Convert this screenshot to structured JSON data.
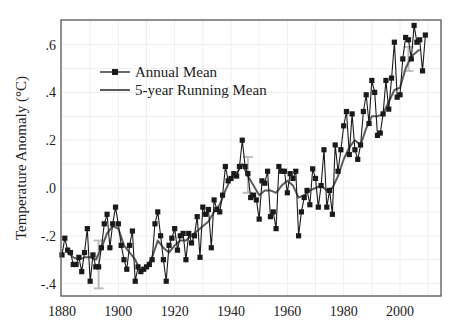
{
  "chart_data": {
    "type": "line",
    "title": "",
    "xlabel": "",
    "ylabel": "Temperature Anomaly (°C)",
    "xlim": [
      1880,
      2010
    ],
    "ylim": [
      -0.45,
      0.7
    ],
    "x_ticks": [
      1880,
      1900,
      1920,
      1940,
      1960,
      1980,
      2000
    ],
    "x_tick_labels": [
      "1880",
      "1900",
      "1920",
      "1940",
      "1960",
      "1980",
      "2000"
    ],
    "y_ticks": [
      -0.4,
      -0.2,
      0.0,
      0.2,
      0.4,
      0.6
    ],
    "y_tick_labels": [
      "-.4",
      "-.2",
      ".0",
      ".2",
      ".4",
      ".6"
    ],
    "grid": true,
    "legend_position": "upper-left",
    "legend": [
      "Annual Mean",
      "5-year Running Mean"
    ],
    "colors": {
      "annual": "#1a1a1a",
      "running": "#5a5a5a",
      "error_bars": "#bdbdbd",
      "grid": "#efefef",
      "axes": "#555555"
    },
    "error_bars": [
      {
        "x": 1893,
        "low": -0.42,
        "high": -0.22
      },
      {
        "x": 1946,
        "low": -0.02,
        "high": 0.13
      },
      {
        "x": 2003,
        "low": 0.49,
        "high": 0.59
      }
    ],
    "series": [
      {
        "name": "Annual Mean",
        "marker": "square",
        "x": [
          1880,
          1881,
          1882,
          1883,
          1884,
          1885,
          1886,
          1887,
          1888,
          1889,
          1890,
          1891,
          1892,
          1893,
          1894,
          1895,
          1896,
          1897,
          1898,
          1899,
          1900,
          1901,
          1902,
          1903,
          1904,
          1905,
          1906,
          1907,
          1908,
          1909,
          1910,
          1911,
          1912,
          1913,
          1914,
          1915,
          1916,
          1917,
          1918,
          1919,
          1920,
          1921,
          1922,
          1923,
          1924,
          1925,
          1926,
          1927,
          1928,
          1929,
          1930,
          1931,
          1932,
          1933,
          1934,
          1935,
          1936,
          1937,
          1938,
          1939,
          1940,
          1941,
          1942,
          1943,
          1944,
          1945,
          1946,
          1947,
          1948,
          1949,
          1950,
          1951,
          1952,
          1953,
          1954,
          1955,
          1956,
          1957,
          1958,
          1959,
          1960,
          1961,
          1962,
          1963,
          1964,
          1965,
          1966,
          1967,
          1968,
          1969,
          1970,
          1971,
          1972,
          1973,
          1974,
          1975,
          1976,
          1977,
          1978,
          1979,
          1980,
          1981,
          1982,
          1983,
          1984,
          1985,
          1986,
          1987,
          1988,
          1989,
          1990,
          1991,
          1992,
          1993,
          1994,
          1995,
          1996,
          1997,
          1998,
          1999,
          2000,
          2001,
          2002,
          2003,
          2004,
          2005,
          2006,
          2007,
          2008,
          2009
        ],
        "values": [
          -0.28,
          -0.21,
          -0.26,
          -0.27,
          -0.32,
          -0.32,
          -0.29,
          -0.35,
          -0.27,
          -0.17,
          -0.39,
          -0.28,
          -0.33,
          -0.33,
          -0.25,
          -0.15,
          -0.11,
          -0.25,
          -0.15,
          -0.08,
          -0.15,
          -0.24,
          -0.3,
          -0.34,
          -0.24,
          -0.18,
          -0.39,
          -0.33,
          -0.35,
          -0.34,
          -0.33,
          -0.32,
          -0.3,
          -0.15,
          -0.1,
          -0.2,
          -0.3,
          -0.39,
          -0.24,
          -0.21,
          -0.17,
          -0.26,
          -0.2,
          -0.19,
          -0.3,
          -0.19,
          -0.23,
          -0.2,
          -0.12,
          -0.29,
          -0.08,
          -0.11,
          -0.09,
          -0.25,
          -0.05,
          -0.09,
          -0.1,
          -0.03,
          0.09,
          0.03,
          0.04,
          0.06,
          0.05,
          0.09,
          0.2,
          0.09,
          0.06,
          -0.04,
          -0.03,
          -0.05,
          -0.13,
          0.03,
          0.02,
          0.07,
          -0.12,
          -0.1,
          -0.17,
          0.09,
          0.07,
          0.07,
          -0.02,
          0.06,
          0.04,
          0.07,
          -0.2,
          -0.1,
          -0.04,
          -0.01,
          -0.07,
          0.08,
          0.04,
          -0.08,
          0.01,
          0.16,
          -0.08,
          -0.01,
          -0.11,
          0.18,
          0.07,
          0.16,
          0.26,
          0.32,
          0.14,
          0.31,
          0.16,
          0.12,
          0.18,
          0.32,
          0.39,
          0.27,
          0.45,
          0.4,
          0.22,
          0.23,
          0.31,
          0.45,
          0.33,
          0.46,
          0.61,
          0.38,
          0.39,
          0.54,
          0.63,
          0.62,
          0.54,
          0.68,
          0.61,
          0.62,
          0.49,
          0.64
        ]
      },
      {
        "name": "5-year Running Mean",
        "marker": "none",
        "x": [
          1882,
          1884,
          1886,
          1888,
          1890,
          1892,
          1894,
          1896,
          1898,
          1900,
          1902,
          1904,
          1906,
          1908,
          1910,
          1912,
          1914,
          1916,
          1918,
          1920,
          1922,
          1924,
          1926,
          1928,
          1930,
          1932,
          1934,
          1936,
          1938,
          1940,
          1942,
          1944,
          1946,
          1948,
          1950,
          1952,
          1954,
          1956,
          1958,
          1960,
          1962,
          1964,
          1966,
          1968,
          1970,
          1972,
          1974,
          1976,
          1978,
          1980,
          1982,
          1984,
          1986,
          1988,
          1990,
          1992,
          1994,
          1996,
          1998,
          2000,
          2002,
          2004,
          2006,
          2007
        ],
        "values": [
          -0.27,
          -0.29,
          -0.3,
          -0.29,
          -0.29,
          -0.3,
          -0.25,
          -0.19,
          -0.16,
          -0.17,
          -0.24,
          -0.27,
          -0.3,
          -0.35,
          -0.33,
          -0.29,
          -0.22,
          -0.25,
          -0.27,
          -0.24,
          -0.22,
          -0.22,
          -0.2,
          -0.18,
          -0.16,
          -0.14,
          -0.1,
          -0.07,
          -0.01,
          0.04,
          0.06,
          0.1,
          0.05,
          0.01,
          -0.03,
          -0.01,
          -0.01,
          -0.02,
          0.01,
          0.03,
          0.01,
          -0.04,
          -0.03,
          -0.01,
          0.0,
          0.01,
          -0.01,
          0.0,
          0.05,
          0.12,
          0.17,
          0.2,
          0.18,
          0.25,
          0.3,
          0.3,
          0.31,
          0.36,
          0.41,
          0.42,
          0.5,
          0.55,
          0.57,
          0.58
        ]
      }
    ]
  }
}
